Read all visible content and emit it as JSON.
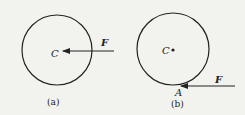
{
  "figure_a": {
    "center_label": "C",
    "force_label": "F",
    "caption": "(a)"
  },
  "figure_b": {
    "center_label": "C",
    "force_label": "F",
    "point_label": "A",
    "caption": "(b)"
  },
  "colors": {
    "background": "#f2f2ee",
    "ink": "#222222"
  }
}
